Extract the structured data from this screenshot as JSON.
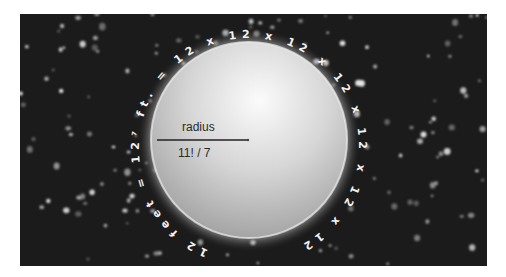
{
  "figure": {
    "sphere_label_top": "radius",
    "sphere_label_bottom": "11! / 7",
    "circumference_text": "12 feet = 12⁷ ft. = 12 x 12 x 12 x 12 x 12 x 12 x 12",
    "colors": {
      "background": "#1b1b1b",
      "sphere_light": "#f7f7f7",
      "sphere_dark": "#9a9a9a",
      "glow": "#d8d8d8",
      "text": "#f2f2f2",
      "label": "#2b2b2b"
    }
  }
}
